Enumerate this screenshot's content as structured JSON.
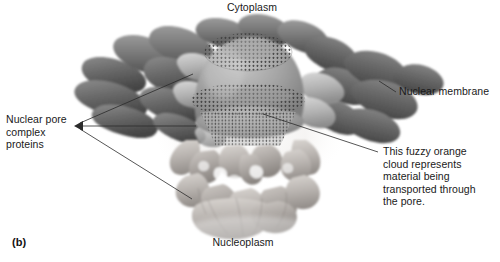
{
  "figure": {
    "panel_label": "(b)",
    "background_color": "#ffffff",
    "text_color": "#1a1a1a",
    "leader_line_color": "#2b2b2b"
  },
  "labels": {
    "cytoplasm": "Cytoplasm",
    "nucleoplasm": "Nucleoplasm",
    "nuclear_membrane": "Nuclear membrane",
    "npc_proteins": "Nuclear pore\ncomplex\nproteins",
    "orange_cloud": "This fuzzy orange\ncloud represents\nmaterial being\ntransported through\nthe pore."
  },
  "artwork": {
    "palette": {
      "membrane_dark": "#6b6b6b",
      "membrane_darker": "#555555",
      "membrane_shadow": "#3f3f3f",
      "spoke_light": "#b4b4b4",
      "spoke_lighter": "#cfcfcf",
      "central_dome": "#9a9a9a",
      "central_dome_light": "#bcbcbc",
      "basket_light": "#c8c4c0",
      "basket_mid": "#a8a39f",
      "basket_shadow": "#8a8682",
      "cloud_haze": "#e8e6e4",
      "stipple": "#3a3a3a",
      "highlight": "#efefef"
    },
    "regions": [
      "cytoplasmic-ring-lobes",
      "central-transporter-dome",
      "stippled-pore-channel",
      "nucleoplasmic-basket",
      "transport-haze-cloud"
    ]
  }
}
